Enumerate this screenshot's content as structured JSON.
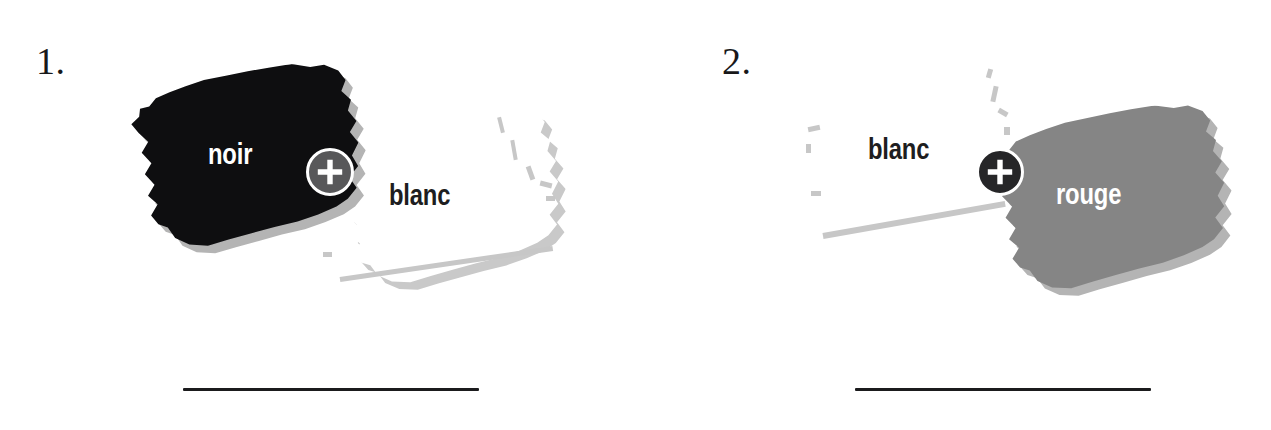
{
  "page": {
    "background_color": "#ffffff",
    "language": "fr"
  },
  "exercises": [
    {
      "number": "1.",
      "operator": "+",
      "operator_icon": "plus-circle-icon",
      "left_swatch": {
        "label": "noir",
        "color": "#0e0e10",
        "label_color": "#ffffff"
      },
      "right_swatch": {
        "label": "blanc",
        "color": "#ffffff",
        "label_color": "#1d1d20"
      },
      "answer_line": ""
    },
    {
      "number": "2.",
      "operator": "+",
      "operator_icon": "plus-circle-icon",
      "left_swatch": {
        "label": "blanc",
        "color": "#ffffff",
        "label_color": "#1d1d20"
      },
      "right_swatch": {
        "label": "rouge",
        "color": "#858585",
        "label_color": "#ffffff"
      },
      "answer_line": ""
    }
  ],
  "colors": {
    "ink": "#1b1b1d",
    "swatch_noir": "#0e0e10",
    "swatch_rouge": "#858585",
    "swatch_blanc": "#ffffff",
    "shadow_gray": "#b4b4b4",
    "outline_gray": "#c7c7c7",
    "badge_1_fill": "#58585a",
    "badge_2_fill": "#262628",
    "badge_ring": "#ffffff"
  }
}
